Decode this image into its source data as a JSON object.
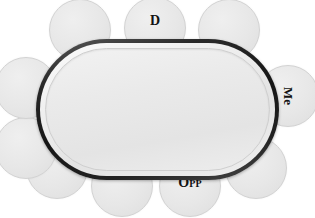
{
  "diagram": {
    "type": "table-seating",
    "colors": {
      "table_rim": "#151515",
      "table_felt": "#eaeaea",
      "seat_fill": "#e7e7e7",
      "seat_border": "#d2d2d2",
      "label_text": "#121212",
      "background": "#ffffff"
    },
    "table": {
      "shape": "stadium",
      "x": 36,
      "y": 39,
      "width": 243,
      "height": 141,
      "corner_radius": 71
    },
    "seat_count": 10,
    "seats": [
      {
        "id": "seat-top-left",
        "label": "",
        "label_style": "none",
        "x": 80,
        "y": 30
      },
      {
        "id": "seat-top-center",
        "label": "D",
        "label_style": "top",
        "x": 155,
        "y": 28
      },
      {
        "id": "seat-top-right",
        "label": "",
        "label_style": "none",
        "x": 229,
        "y": 30
      },
      {
        "id": "seat-right",
        "label": "Me",
        "label_style": "right",
        "x": 288,
        "y": 96
      },
      {
        "id": "seat-bottom-right",
        "label": "",
        "label_style": "none",
        "x": 256,
        "y": 168
      },
      {
        "id": "seat-bottom-opp",
        "label": "Opp",
        "label_style": "bottom",
        "x": 190,
        "y": 186
      },
      {
        "id": "seat-bottom-mid",
        "label": "",
        "label_style": "none",
        "x": 122,
        "y": 186
      },
      {
        "id": "seat-bottom-left",
        "label": "",
        "label_style": "none",
        "x": 57,
        "y": 168
      },
      {
        "id": "seat-left-lower",
        "label": "",
        "label_style": "none",
        "x": 26,
        "y": 148
      },
      {
        "id": "seat-left-upper",
        "label": "",
        "label_style": "none",
        "x": 26,
        "y": 88
      }
    ]
  }
}
